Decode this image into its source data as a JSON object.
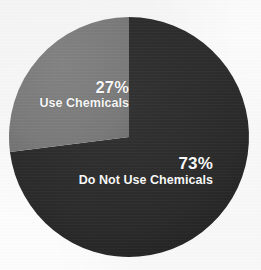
{
  "chart_data": {
    "type": "pie",
    "title": "",
    "subtitle": "",
    "xlabel": "",
    "ylabel": "",
    "legend_position": "none",
    "grid": false,
    "labels_on_slices": true,
    "total": 100,
    "unit": "%",
    "categories": [
      "Do Not Use Chemicals",
      "Use Chemicals"
    ],
    "values": [
      73,
      27
    ],
    "slices": [
      {
        "label": "Do Not Use Chemicals",
        "value": 73,
        "value_text": "73%",
        "color": "#2b2b2b",
        "start_angle_deg": 0,
        "end_angle_deg": 262.8,
        "label_position": "right-lower"
      },
      {
        "label": "Use Chemicals",
        "value": 27,
        "value_text": "27%",
        "color": "#7d7d7d",
        "start_angle_deg": 262.8,
        "end_angle_deg": 360,
        "label_position": "left-upper"
      }
    ],
    "colors": {
      "slice_dark": "#2b2b2b",
      "slice_light": "#7d7d7d",
      "label_text": "#ffffff",
      "background": "#fdfdfd"
    },
    "geometry": {
      "center_x": 129,
      "center_y": 137,
      "radius": 120
    }
  },
  "labels": {
    "use_chemicals": {
      "percent": "27%",
      "category": "Use Chemicals"
    },
    "do_not_use_chemicals": {
      "percent": "73%",
      "category": "Do Not Use Chemicals"
    }
  }
}
